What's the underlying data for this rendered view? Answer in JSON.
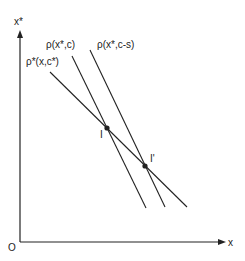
{
  "diagram": {
    "axes": {
      "y_label": "x*",
      "x_label": "x",
      "origin_label": "O"
    },
    "curves": [
      {
        "label": "ρ*(x,c*)",
        "x1": 50,
        "y1": 72,
        "x2": 187,
        "y2": 207
      },
      {
        "label": "ρ(x*,c)",
        "x1": 72,
        "y1": 56,
        "x2": 146,
        "y2": 208
      },
      {
        "label": "ρ(x*,c-s)",
        "x1": 90,
        "y1": 50,
        "x2": 165,
        "y2": 207
      }
    ],
    "points": [
      {
        "label": "I",
        "x": 107,
        "y": 128
      },
      {
        "label": "I'",
        "x": 145,
        "y": 166
      }
    ],
    "colors": {
      "ink": "#222222",
      "background": "#ffffff"
    }
  }
}
